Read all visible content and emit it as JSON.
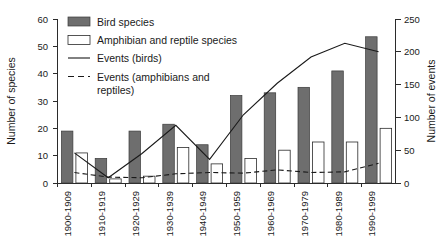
{
  "chart_data": {
    "type": "bar",
    "title": "",
    "subtitle": "",
    "xlabel": "",
    "ylabel": "Number of species",
    "y2label": "Number of events",
    "ylim": [
      0,
      60
    ],
    "y2lim": [
      0,
      250
    ],
    "yticks": [
      "0",
      "10",
      "20",
      "30",
      "40",
      "50",
      "60"
    ],
    "y2ticks": [
      "0",
      "50",
      "100",
      "150",
      "200",
      "250"
    ],
    "grid": false,
    "legend_position": "top-center",
    "categories": [
      "1900-1909",
      "1910-1919",
      "1920-1929",
      "1930-1939",
      "1940-1949",
      "1950-1959",
      "1960-1969",
      "1970-1979",
      "1980-1989",
      "1990-1999"
    ],
    "series": [
      {
        "name": "Bird species",
        "kind": "bar",
        "axis": "left",
        "color": "#6e6e6e",
        "values": [
          19,
          9,
          19,
          21.5,
          14,
          32,
          33,
          35,
          41,
          53.5
        ]
      },
      {
        "name": "Amphibian and reptile species",
        "kind": "bar",
        "axis": "left",
        "color": "#ffffff",
        "values": [
          11,
          1.5,
          2.5,
          13,
          7,
          9,
          12,
          15,
          15,
          20
        ]
      },
      {
        "name": "Events (birds)",
        "kind": "line",
        "axis": "right",
        "style": "solid",
        "color": "#1a1a1a",
        "values": [
          46,
          8,
          45,
          88,
          36,
          104,
          152,
          192,
          213,
          200
        ]
      },
      {
        "name": "Events (amphibians and reptiles)",
        "kind": "line",
        "axis": "right",
        "style": "dashed",
        "color": "#1a1a1a",
        "values": [
          16,
          9,
          8,
          14,
          16,
          15,
          20,
          16,
          17,
          30
        ]
      }
    ]
  },
  "legend": {
    "items": [
      {
        "label": "Bird species",
        "marker": "filled-swatch"
      },
      {
        "label": "Amphibian and reptile species",
        "marker": "open-swatch"
      },
      {
        "label": "Events (birds)",
        "marker": "solid-line"
      },
      {
        "label": "Events (amphibians and",
        "marker": "dashed-line"
      },
      {
        "label": "reptiles)",
        "marker": "none"
      }
    ]
  }
}
